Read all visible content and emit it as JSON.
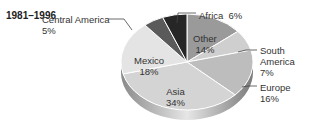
{
  "chart_data": {
    "type": "pie",
    "title": "1981–1996",
    "categories": [
      "Other",
      "South America",
      "Europe",
      "Asia",
      "Mexico",
      "Central America",
      "Africa"
    ],
    "values": [
      14,
      7,
      16,
      34,
      18,
      5,
      6
    ],
    "unit": "%",
    "colors": [
      "#9a9a9a",
      "#cfcfcf",
      "#bdbdbd",
      "#d4d4d4",
      "#e4e4e4",
      "#5a5a5a",
      "#262626"
    ],
    "style": "3d-tilted",
    "legend": "none (direct labels)"
  },
  "labels": {
    "title": "1981–1996",
    "other": {
      "name": "Other",
      "pct": "14%"
    },
    "south_america": {
      "name1": "South",
      "name2": "America",
      "pct": "7%"
    },
    "europe": {
      "name": "Europe",
      "pct": "16%"
    },
    "asia": {
      "name": "Asia",
      "pct": "34%"
    },
    "mexico": {
      "name": "Mexico",
      "pct": "18%"
    },
    "central_america": {
      "name": "Central America",
      "pct": "5%"
    },
    "africa": {
      "name": "Africa",
      "pct": "6%"
    }
  }
}
